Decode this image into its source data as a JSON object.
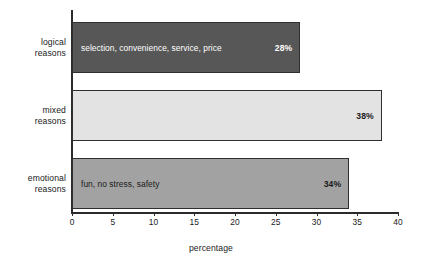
{
  "chart_data": {
    "type": "bar",
    "orientation": "horizontal",
    "title": "",
    "xlabel": "percentage",
    "ylabel": "",
    "categories": [
      "logical reasons",
      "mixed reasons",
      "emotional reasons"
    ],
    "values": [
      28,
      38,
      34
    ],
    "value_labels": [
      "28%",
      "38%",
      "34%"
    ],
    "bar_descriptions": [
      "selection, convenience, service, price",
      "",
      "fun, no stress, safety"
    ],
    "bar_colors": [
      "#575757",
      "#e3e3e3",
      "#a2a2a2"
    ],
    "bar_label_colors": [
      "#ffffff",
      "#1a1a1a",
      "#1a1a1a"
    ],
    "xlim": [
      0,
      40
    ],
    "xticks": [
      0,
      5,
      10,
      15,
      20,
      25,
      30,
      35,
      40
    ],
    "xtick_labels": [
      "0",
      "5",
      "10",
      "15",
      "20",
      "25",
      "30",
      "35",
      "40"
    ],
    "grid": false,
    "legend": "none",
    "axis_color": "#2b2b2b",
    "background": "#ffffff"
  },
  "labels": {
    "cat0_line1": "logical",
    "cat0_line2": "reasons",
    "cat1_line1": "mixed",
    "cat1_line2": "reasons",
    "cat2_line1": "emotional",
    "cat2_line2": "reasons"
  }
}
